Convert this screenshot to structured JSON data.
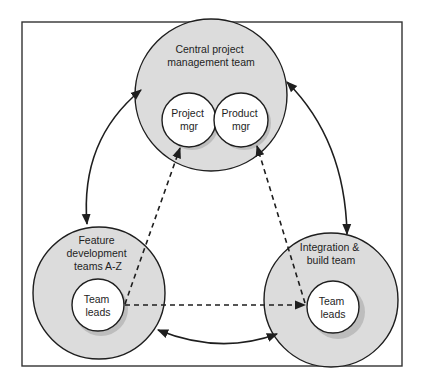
{
  "diagram": {
    "nodes": {
      "central": {
        "label_lines": [
          "Central project",
          "management team"
        ]
      },
      "project_mgr": {
        "label_lines": [
          "Project",
          "mgr"
        ]
      },
      "product_mgr": {
        "label_lines": [
          "Product",
          "mgr"
        ]
      },
      "feature": {
        "label_lines": [
          "Feature",
          "development",
          "teams A-Z"
        ]
      },
      "feature_leads": {
        "label_lines": [
          "Team",
          "leads"
        ]
      },
      "integration": {
        "label_lines": [
          "Integration &",
          "build team"
        ]
      },
      "integration_leads": {
        "label_lines": [
          "Team",
          "leads"
        ]
      }
    },
    "edges": [
      {
        "from": "central",
        "to": "feature",
        "style": "solid",
        "direction": "both"
      },
      {
        "from": "central",
        "to": "integration",
        "style": "solid",
        "direction": "both"
      },
      {
        "from": "feature",
        "to": "integration",
        "style": "solid",
        "direction": "both"
      },
      {
        "from": "feature_leads",
        "to": "project_mgr",
        "style": "dashed",
        "direction": "forward"
      },
      {
        "from": "feature_leads",
        "to": "integration_leads",
        "style": "dashed",
        "direction": "forward"
      },
      {
        "from": "integration_leads",
        "to": "product_mgr",
        "style": "dashed",
        "direction": "forward"
      }
    ]
  }
}
